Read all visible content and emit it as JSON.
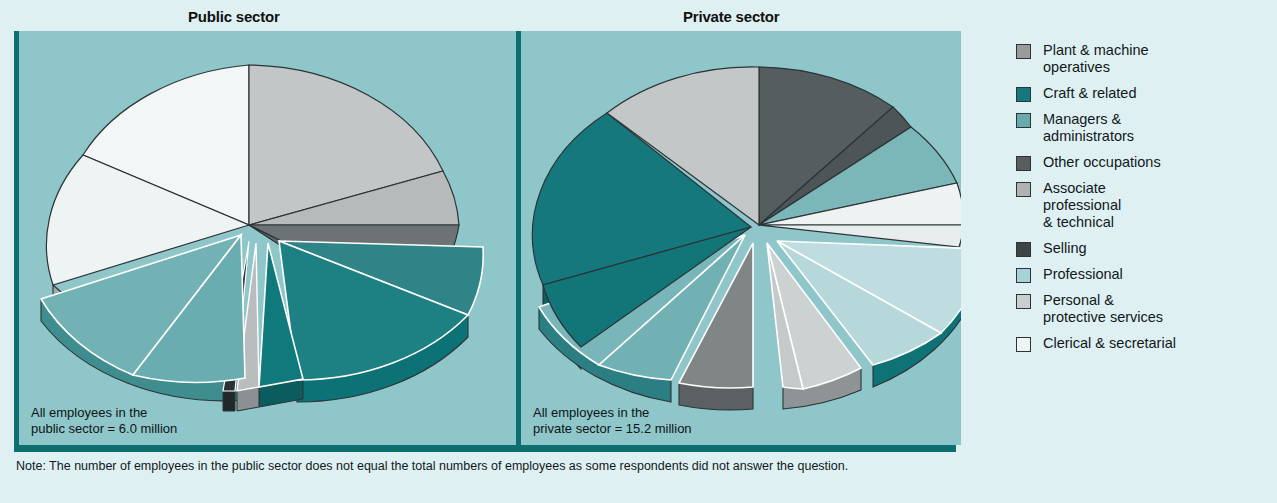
{
  "figure": {
    "note": "Note: The number of employees in the public sector does not equal the total numbers of employees as some respondents did not answer the question."
  },
  "panels": {
    "public": {
      "title": "Public sector",
      "caption": "All employees in the\npublic sector = 6.0 million"
    },
    "private": {
      "title": "Private sector",
      "caption": "All employees in the\nprivate sector = 15.2 million"
    }
  },
  "legend": {
    "items": [
      {
        "label": "Plant & machine\noperatives",
        "color": "#9a9a9a",
        "key": "plant-machine-operatives"
      },
      {
        "label": "Craft & related",
        "color": "#14787c",
        "key": "craft-related"
      },
      {
        "label": "Managers &\nadministrators",
        "color": "#6aa9ac",
        "key": "managers-administrators"
      },
      {
        "label": "Other occupations",
        "color": "#565e60",
        "key": "other-occupations"
      },
      {
        "label": "Associate\nprofessional\n& technical",
        "color": "#b0b2b2",
        "key": "associate-professional-technical"
      },
      {
        "label": "Selling",
        "color": "#3d4547",
        "key": "selling"
      },
      {
        "label": "Professional",
        "color": "#a9d2d6",
        "key": "professional"
      },
      {
        "label": "Personal &\nprotective services",
        "color": "#c9cfd0",
        "key": "personal-protective-services"
      },
      {
        "label": "Clerical & secretarial",
        "color": "#eef3f3",
        "key": "clerical-secretarial"
      }
    ]
  },
  "palette": {
    "page_background": "#dff0f2",
    "panel_background": "#8fc6c9",
    "panel_rule": "#0d6e70",
    "text": "#11181a"
  },
  "chart_data": [
    {
      "type": "pie",
      "title": "Public sector",
      "total_label": "All employees in the public sector = 6.0 million",
      "total_millions": 6.0,
      "exploded": true,
      "three_d": true,
      "categories": [
        "Associate professional & technical",
        "Other occupations",
        "Managers & administrators",
        "Craft & related",
        "Plant & machine operatives",
        "Selling",
        "Professional",
        "Clerical & secretarial",
        "Personal & protective services"
      ],
      "values": [
        14,
        10,
        11,
        6,
        3,
        1,
        17,
        22,
        16
      ],
      "units": "percent of public sector employees",
      "legend_position": "right"
    },
    {
      "type": "pie",
      "title": "Private sector",
      "total_label": "All employees in the private sector = 15.2 million",
      "total_millions": 15.2,
      "exploded": true,
      "three_d": true,
      "categories": [
        "Selling",
        "Professional",
        "Personal & protective services",
        "Clerical & secretarial",
        "Associate professional & technical",
        "Other occupations",
        "Managers & administrators",
        "Craft & related",
        "Plant & machine operatives"
      ],
      "values": [
        11,
        4,
        10,
        15,
        8,
        8,
        13,
        17,
        14
      ],
      "units": "percent of private sector employees",
      "legend_position": "right"
    }
  ]
}
